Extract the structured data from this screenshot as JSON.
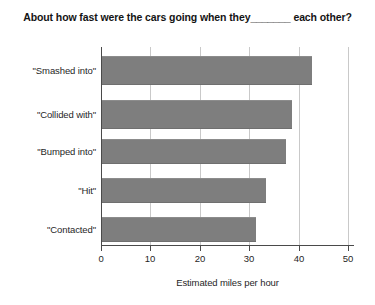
{
  "chart_data": {
    "type": "bar",
    "orientation": "horizontal",
    "title": "About how fast were the cars going when they_______ each other?",
    "xlabel": "Estimated miles per hour",
    "ylabel": "",
    "categories": [
      "\"Smashed into\"",
      "\"Collided with\"",
      "\"Bumped into\"",
      "\"Hit\"",
      "\"Contacted\""
    ],
    "values": [
      42.7,
      38.7,
      37.4,
      33.4,
      31.4
    ],
    "xlim": [
      0,
      50
    ],
    "xticks": [
      "0",
      "10",
      "20",
      "30",
      "40",
      "50"
    ],
    "xtick_values": [
      0,
      10,
      20,
      30,
      40,
      50
    ],
    "grid": "vertical",
    "legend": "none",
    "bar_color": "#7e7e7e",
    "gridline_color": "#c9c9c9",
    "axis_color": "#4a4a4a"
  }
}
